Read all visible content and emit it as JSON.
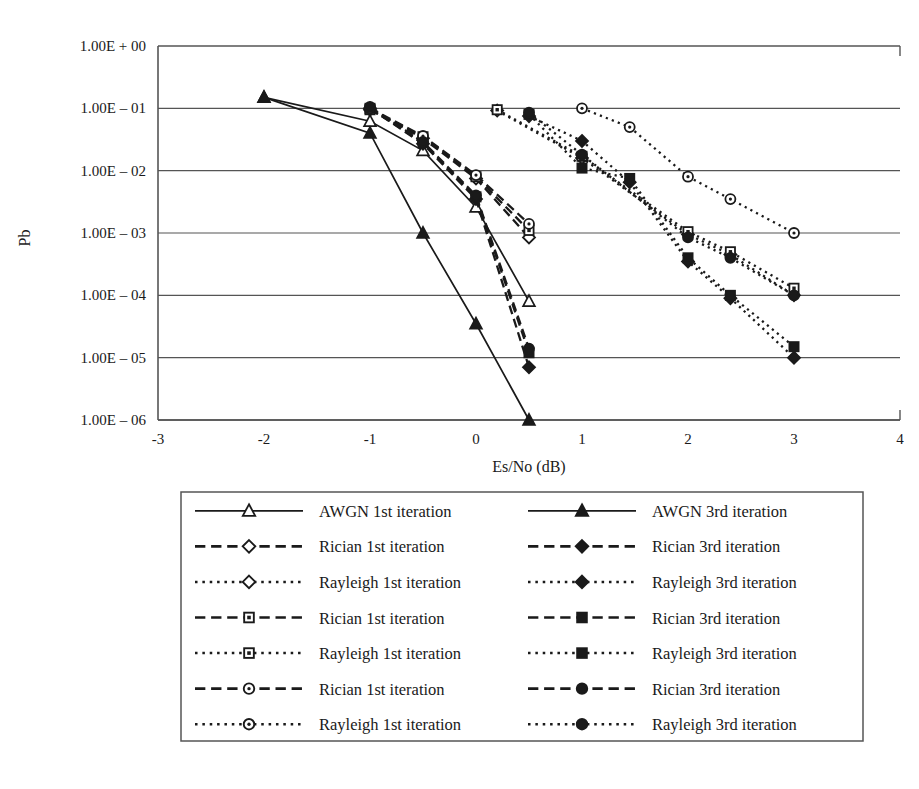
{
  "chart_data": {
    "type": "line",
    "title": "",
    "xlabel": "Es/No (dB)",
    "ylabel": "Pb",
    "xlim": [
      -3,
      4
    ],
    "ylim": [
      1e-06,
      1
    ],
    "yscale": "log",
    "grid": "horizontal",
    "xticks": [
      "-3",
      "-2",
      "-1",
      "0",
      "1",
      "2",
      "3",
      "4"
    ],
    "xtick_values": [
      -3,
      -2,
      -1,
      0,
      1,
      2,
      3,
      4
    ],
    "yticks": [
      "1.00E + 00",
      "1.00E – 01",
      "1.00E – 02",
      "1.00E – 03",
      "1.00E – 04",
      "1.00E – 05",
      "1.00E – 06"
    ],
    "ytick_values": [
      1,
      0.1,
      0.01,
      0.001,
      0.0001,
      1e-05,
      1e-06
    ],
    "legend_position": "below",
    "series": [
      {
        "name": "AWGN 1st iteration",
        "marker": "triangle-open",
        "line": "solid",
        "x": [
          -2,
          -1,
          -0.5,
          0,
          0.5
        ],
        "y": [
          0.15,
          0.062,
          0.021,
          0.0026,
          8e-05
        ]
      },
      {
        "name": "AWGN 3rd iteration",
        "marker": "triangle-filled",
        "line": "solid",
        "x": [
          -2,
          -1,
          -0.5,
          0,
          0.5
        ],
        "y": [
          0.15,
          0.04,
          0.001,
          3.5e-05,
          1e-06
        ]
      },
      {
        "name": "Rician 1st iteration (diamond)",
        "marker": "diamond-open",
        "line": "dashed",
        "x": [
          -1,
          -0.5,
          0,
          0.5
        ],
        "y": [
          0.095,
          0.033,
          0.0075,
          0.00085
        ]
      },
      {
        "name": "Rician 3rd iteration (diamond)",
        "marker": "diamond-filled",
        "line": "dashed",
        "x": [
          -1,
          -0.5,
          0,
          0.5
        ],
        "y": [
          0.1,
          0.027,
          0.0035,
          7e-06
        ]
      },
      {
        "name": "Rayleigh 1st iteration (diamond)",
        "marker": "diamond-open",
        "line": "dotted",
        "x": [
          0.2,
          1,
          2,
          2.4,
          3
        ],
        "y": [
          0.092,
          0.016,
          0.00095,
          0.00045,
          0.0001
        ]
      },
      {
        "name": "Rayleigh 3rd iteration (diamond)",
        "marker": "diamond-filled",
        "line": "dotted",
        "x": [
          0.5,
          1,
          1.45,
          2,
          2.4,
          3
        ],
        "y": [
          0.075,
          0.03,
          0.0065,
          0.00035,
          9e-05,
          1e-05
        ]
      },
      {
        "name": "Rician 1st iteration (square)",
        "marker": "square-open",
        "line": "dashed",
        "x": [
          -1,
          -0.5,
          0,
          0.5
        ],
        "y": [
          0.095,
          0.035,
          0.008,
          0.0011
        ]
      },
      {
        "name": "Rician 3rd iteration (square)",
        "marker": "square-filled",
        "line": "dashed",
        "x": [
          -1,
          -0.5,
          0,
          0.5
        ],
        "y": [
          0.1,
          0.028,
          0.0038,
          1.2e-05
        ]
      },
      {
        "name": "Rayleigh 1st iteration (square)",
        "marker": "square-open",
        "line": "dotted",
        "x": [
          0.2,
          1,
          2,
          2.4,
          3
        ],
        "y": [
          0.095,
          0.017,
          0.00105,
          0.0005,
          0.00013
        ]
      },
      {
        "name": "Rayleigh 3rd iteration (square)",
        "marker": "square-filled",
        "line": "dotted",
        "x": [
          0.5,
          1,
          1.45,
          2,
          2.4,
          3
        ],
        "y": [
          0.08,
          0.011,
          0.0075,
          0.0004,
          0.0001,
          1.5e-05
        ]
      },
      {
        "name": "Rician 1st iteration (circle)",
        "marker": "circle-open",
        "line": "dashed",
        "x": [
          -1,
          -0.5,
          0,
          0.5
        ],
        "y": [
          0.1,
          0.036,
          0.0085,
          0.0014
        ]
      },
      {
        "name": "Rician 3rd iteration (circle)",
        "marker": "circle-filled",
        "line": "dashed",
        "x": [
          -1,
          -0.5,
          0,
          0.5
        ],
        "y": [
          0.105,
          0.029,
          0.004,
          1.4e-05
        ]
      },
      {
        "name": "Rayleigh 1st iteration (circle)",
        "marker": "circle-open",
        "line": "dotted",
        "x": [
          1,
          1.45,
          2,
          2.4,
          3
        ],
        "y": [
          0.1,
          0.05,
          0.008,
          0.0035,
          0.001
        ]
      },
      {
        "name": "Rayleigh 3rd iteration (circle)",
        "marker": "circle-filled",
        "line": "dotted",
        "x": [
          0.5,
          1,
          2,
          2.4,
          3
        ],
        "y": [
          0.085,
          0.018,
          0.00085,
          0.0004,
          0.0001
        ]
      }
    ]
  },
  "axes": {
    "ylabel": "Pb",
    "xlabel": "Es/No (dB)",
    "yticks": [
      "1.00E + 00",
      "1.00E – 01",
      "1.00E – 02",
      "1.00E – 03",
      "1.00E – 04",
      "1.00E – 05",
      "1.00E – 06"
    ],
    "xticks": [
      "-3",
      "-2",
      "-1",
      "0",
      "1",
      "2",
      "3",
      "4"
    ]
  },
  "legend": {
    "rows": [
      {
        "left": {
          "label": "AWGN 1st iteration",
          "marker": "triangle-open",
          "line": "solid"
        },
        "right": {
          "label": "AWGN 3rd iteration",
          "marker": "triangle-filled",
          "line": "solid"
        }
      },
      {
        "left": {
          "label": "Rician 1st iteration",
          "marker": "diamond-open",
          "line": "dashed"
        },
        "right": {
          "label": "Rician 3rd iteration",
          "marker": "diamond-filled",
          "line": "dashed"
        }
      },
      {
        "left": {
          "label": "Rayleigh 1st iteration",
          "marker": "diamond-open",
          "line": "dotted"
        },
        "right": {
          "label": "Rayleigh 3rd iteration",
          "marker": "diamond-filled",
          "line": "dotted"
        }
      },
      {
        "left": {
          "label": "Rician 1st iteration",
          "marker": "square-open",
          "line": "dashed"
        },
        "right": {
          "label": "Rician 3rd iteration",
          "marker": "square-filled",
          "line": "dashed"
        }
      },
      {
        "left": {
          "label": "Rayleigh 1st iteration",
          "marker": "square-open",
          "line": "dotted"
        },
        "right": {
          "label": "Rayleigh 3rd iteration",
          "marker": "square-filled",
          "line": "dotted"
        }
      },
      {
        "left": {
          "label": "Rician 1st iteration",
          "marker": "circle-open",
          "line": "dashed"
        },
        "right": {
          "label": "Rician 3rd iteration",
          "marker": "circle-filled",
          "line": "dashed"
        }
      },
      {
        "left": {
          "label": "Rayleigh 1st iteration",
          "marker": "circle-open",
          "line": "dotted"
        },
        "right": {
          "label": "Rayleigh 3rd iteration",
          "marker": "circle-filled",
          "line": "dotted"
        }
      }
    ]
  },
  "colors": {
    "ink": "#1a1a1a",
    "axis": "#555555",
    "grid": "#555555",
    "background": "#ffffff"
  }
}
